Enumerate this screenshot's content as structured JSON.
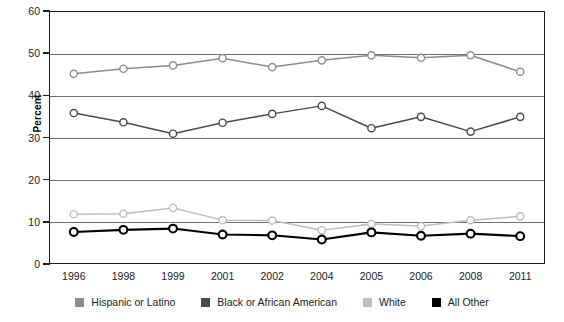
{
  "chart_data": {
    "type": "line",
    "title": "",
    "xlabel": "",
    "ylabel": "Percent",
    "ylim": [
      0,
      60
    ],
    "yticks": [
      0,
      10,
      20,
      30,
      40,
      50,
      60
    ],
    "grid": true,
    "legend_position": "bottom",
    "categories": [
      "1996",
      "1998",
      "1999",
      "2001",
      "2002",
      "2004",
      "2005",
      "2006",
      "2008",
      "2011"
    ],
    "series": [
      {
        "name": "Hispanic or Latino",
        "color": "#8c8c8c",
        "marker": "open-circle",
        "values": [
          45.1,
          46.3,
          47.1,
          48.8,
          46.7,
          48.3,
          49.5,
          48.9,
          49.5,
          45.6
        ]
      },
      {
        "name": "Black or African American",
        "color": "#4a4a4a",
        "marker": "open-circle",
        "values": [
          35.8,
          33.6,
          30.9,
          33.5,
          35.6,
          37.5,
          32.2,
          34.9,
          31.4,
          34.9
        ]
      },
      {
        "name": "White",
        "color": "#bdbdbd",
        "marker": "open-circle",
        "values": [
          11.8,
          11.9,
          13.3,
          10.4,
          10.3,
          8.0,
          9.5,
          9.0,
          10.4,
          11.3
        ]
      },
      {
        "name": "All Other",
        "color": "#000000",
        "marker": "open-circle",
        "values": [
          7.6,
          8.1,
          8.4,
          7.0,
          6.8,
          5.8,
          7.5,
          6.7,
          7.2,
          6.6
        ]
      }
    ]
  },
  "legend": {
    "items": [
      {
        "label": "Hispanic or Latino",
        "color": "#8c8c8c"
      },
      {
        "label": "Black or African American",
        "color": "#4a4a4a"
      },
      {
        "label": "White",
        "color": "#bdbdbd"
      },
      {
        "label": "All Other",
        "color": "#000000"
      }
    ]
  },
  "axis": {
    "y_title": "Percent"
  }
}
